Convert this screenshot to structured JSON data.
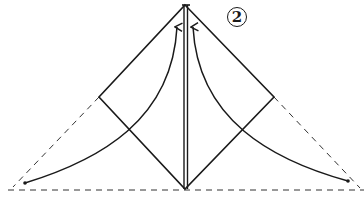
{
  "diagram": {
    "type": "origami-fold-instruction",
    "step_number": "2",
    "colors": {
      "line": "#1a1a1a",
      "dashed": "#333333",
      "background": "#ffffff"
    },
    "elements": [
      "square-diamond-outline",
      "center-vertical-double-line",
      "left-dashed-flap-edge",
      "right-dashed-flap-edge",
      "dashed-baseline",
      "left-curved-fold-arrow",
      "right-curved-fold-arrow",
      "step-number-circle"
    ]
  }
}
